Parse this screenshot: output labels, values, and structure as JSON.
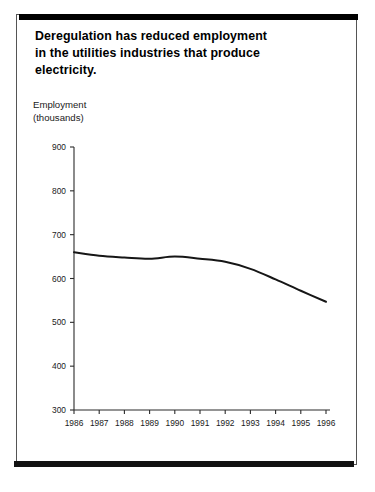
{
  "slide": {
    "title": "Deregulation has reduced employment\nin the utilities industries that produce\nelectricity.",
    "axis_caption": "Employment\n(thousands)"
  },
  "colors": {
    "line": "#161616",
    "axis": "#2b2b2b",
    "rule": "#000000",
    "background": "#ffffff",
    "frame_border": "#555555"
  },
  "chart_data": {
    "type": "line",
    "title": "Deregulation has reduced employment in the utilities industries that produce electricity.",
    "xlabel": "",
    "ylabel": "Employment (thousands)",
    "ylim": [
      300,
      900
    ],
    "xlim": [
      1986,
      1996
    ],
    "grid": false,
    "legend": "none",
    "y_ticks": [
      300,
      400,
      500,
      600,
      700,
      800,
      900
    ],
    "y_tick_labels": [
      "300",
      "400",
      "500",
      "600",
      "700",
      "800",
      "900"
    ],
    "x_ticks": [
      1986,
      1987,
      1988,
      1989,
      1990,
      1991,
      1992,
      1993,
      1994,
      1995,
      1996
    ],
    "x_tick_labels": [
      "1986",
      "1987",
      "1988",
      "1989",
      "1990",
      "1991",
      "1992",
      "1993",
      "1994",
      "1995",
      "1996"
    ],
    "categories": [
      1986,
      1987,
      1988,
      1989,
      1990,
      1991,
      1992,
      1993,
      1994,
      1995,
      1996
    ],
    "values": [
      660,
      652,
      648,
      645,
      650,
      645,
      638,
      622,
      598,
      572,
      547
    ],
    "series": [
      {
        "name": "Employment in electricity-producing utilities",
        "values": [
          660,
          652,
          648,
          645,
          650,
          645,
          638,
          622,
          598,
          572,
          547
        ]
      }
    ]
  }
}
